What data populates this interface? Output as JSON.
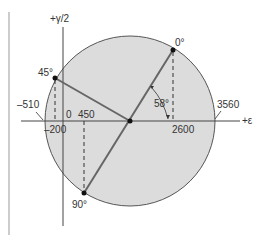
{
  "diagram": {
    "type": "mohr-circle-strain",
    "axes": {
      "vertical_label": "+γ/2",
      "horizontal_label": "+ε"
    },
    "circle": {
      "fill": "#dcdcdc",
      "stroke": "#555555",
      "center_value": 1525,
      "left_intercept_label": "–510",
      "right_intercept_label": "3560"
    },
    "points": [
      {
        "angle_label": "0°",
        "epsilon_label": "2600"
      },
      {
        "angle_label": "45°",
        "epsilon_label": "–200"
      },
      {
        "angle_label": "90°",
        "epsilon_label": "450"
      }
    ],
    "origin_label": "0",
    "rotation_angle_label": "58°"
  }
}
